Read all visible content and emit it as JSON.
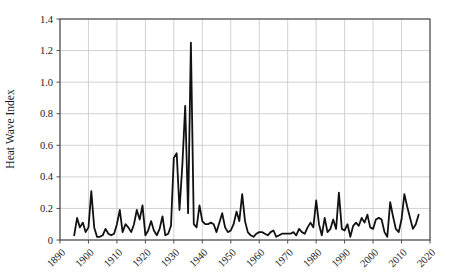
{
  "figure": {
    "background": "#ffffff"
  },
  "chart_data": {
    "type": "line",
    "title": "",
    "xlabel": "",
    "ylabel": "Heat Wave Index",
    "xlim": [
      1890,
      2020
    ],
    "ylim": [
      0,
      1.4
    ],
    "grid": true,
    "legend": "none",
    "x_ticks": [
      1890,
      1900,
      1910,
      1920,
      1930,
      1940,
      1950,
      1960,
      1970,
      1980,
      1990,
      2000,
      2010,
      2020
    ],
    "x_tick_labels": [
      "1890",
      "1900",
      "1910",
      "1920",
      "1930",
      "1940",
      "1950",
      "1960",
      "1970",
      "1980",
      "1990",
      "2000",
      "2010",
      "2020"
    ],
    "y_ticks": [
      0,
      0.2,
      0.4,
      0.6,
      0.8,
      1.0,
      1.2,
      1.4
    ],
    "y_tick_labels": [
      "0",
      "0.2",
      "0.4",
      "0.6",
      "0.8",
      "1.0",
      "1.2",
      "1.4"
    ],
    "line_color": "#111111",
    "grid_color": "#cccccc",
    "axis_color": "#4d4d4d",
    "x": [
      1895,
      1896,
      1897,
      1898,
      1899,
      1900,
      1901,
      1902,
      1903,
      1904,
      1905,
      1906,
      1907,
      1908,
      1909,
      1910,
      1911,
      1912,
      1913,
      1914,
      1915,
      1916,
      1917,
      1918,
      1919,
      1920,
      1921,
      1922,
      1923,
      1924,
      1925,
      1926,
      1927,
      1928,
      1929,
      1930,
      1931,
      1932,
      1933,
      1934,
      1935,
      1936,
      1937,
      1938,
      1939,
      1940,
      1941,
      1942,
      1943,
      1944,
      1945,
      1946,
      1947,
      1948,
      1949,
      1950,
      1951,
      1952,
      1953,
      1954,
      1955,
      1956,
      1957,
      1958,
      1959,
      1960,
      1961,
      1962,
      1963,
      1964,
      1965,
      1966,
      1967,
      1968,
      1969,
      1970,
      1971,
      1972,
      1973,
      1974,
      1975,
      1976,
      1977,
      1978,
      1979,
      1980,
      1981,
      1982,
      1983,
      1984,
      1985,
      1986,
      1987,
      1988,
      1989,
      1990,
      1991,
      1992,
      1993,
      1994,
      1995,
      1996,
      1997,
      1998,
      1999,
      2000,
      2001,
      2002,
      2003,
      2004,
      2005,
      2006,
      2007,
      2008,
      2009,
      2010,
      2011,
      2012,
      2013,
      2014,
      2015,
      2016
    ],
    "y": [
      0.03,
      0.14,
      0.08,
      0.11,
      0.05,
      0.08,
      0.31,
      0.08,
      0.02,
      0.02,
      0.03,
      0.07,
      0.04,
      0.03,
      0.04,
      0.1,
      0.19,
      0.05,
      0.1,
      0.08,
      0.05,
      0.1,
      0.19,
      0.13,
      0.22,
      0.03,
      0.06,
      0.12,
      0.06,
      0.03,
      0.07,
      0.15,
      0.03,
      0.04,
      0.09,
      0.52,
      0.55,
      0.19,
      0.48,
      0.85,
      0.17,
      1.25,
      0.1,
      0.08,
      0.22,
      0.12,
      0.1,
      0.1,
      0.11,
      0.1,
      0.05,
      0.11,
      0.17,
      0.08,
      0.05,
      0.06,
      0.1,
      0.18,
      0.12,
      0.29,
      0.12,
      0.05,
      0.03,
      0.02,
      0.04,
      0.05,
      0.05,
      0.04,
      0.03,
      0.05,
      0.06,
      0.02,
      0.03,
      0.04,
      0.04,
      0.04,
      0.04,
      0.05,
      0.03,
      0.07,
      0.05,
      0.04,
      0.08,
      0.11,
      0.08,
      0.25,
      0.1,
      0.03,
      0.14,
      0.05,
      0.07,
      0.13,
      0.07,
      0.3,
      0.07,
      0.06,
      0.1,
      0.02,
      0.09,
      0.11,
      0.09,
      0.14,
      0.11,
      0.16,
      0.08,
      0.07,
      0.13,
      0.14,
      0.13,
      0.05,
      0.02,
      0.24,
      0.15,
      0.07,
      0.05,
      0.13,
      0.29,
      0.21,
      0.14,
      0.07,
      0.1,
      0.16
    ]
  }
}
